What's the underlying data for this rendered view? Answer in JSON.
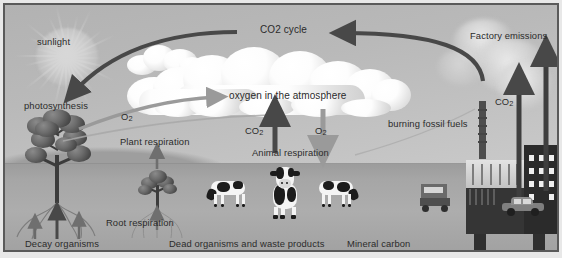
{
  "diagram": {
    "title": "CO2 cycle",
    "labels": {
      "sunlight": "sunlight",
      "co2_cycle": "CO2 cycle",
      "factory_emissions": "Factory emissions",
      "oxygen_atmosphere": "oxygen in the atmosphere",
      "photosynthesis": "photosynthesis",
      "o2_photosynthesis": "O",
      "o2_photosynthesis_sub": "2",
      "plant_respiration": "Plant respiration",
      "root_respiration": "Root respiration",
      "decay_organisms": "Decay organisms",
      "co2_animal": "CO",
      "co2_animal_sub": "2",
      "o2_animal": "O",
      "o2_animal_sub": "2",
      "animal_respiration": "Animal respiration",
      "dead_organisms": "Dead organisms and waste products",
      "mineral_carbon": "Mineral carbon",
      "burning_fossil_fuels": "burning fossil fuels",
      "co2_factory": "CO",
      "co2_factory_sub": "2"
    },
    "colors": {
      "frame_border": "#5a5a5a",
      "sky_top": "#b2b2b2",
      "sky_bottom": "#c9c9c9",
      "ground": "#a6a6a6",
      "arrow_dark": "#4a4a4a",
      "arrow_mid": "#6f6f6f",
      "arrow_light": "#9a9a9a",
      "cloud_white": "#ffffff",
      "text": "#2b2b2b"
    },
    "icons": {
      "sun": "sun-icon",
      "cloud": "cloud-icon",
      "tree": "tree-icon",
      "shrub": "shrub-icon",
      "cow": "cow-icon",
      "factory": "factory-icon",
      "car": "car-icon",
      "truck": "truck-icon",
      "chimney": "chimney-icon",
      "roots": "roots-icon"
    },
    "arrows": [
      {
        "name": "sunlight-to-photosynthesis",
        "tone": "dark"
      },
      {
        "name": "co2-cycle-return",
        "tone": "dark"
      },
      {
        "name": "factory-to-co2-cycle",
        "tone": "dark"
      },
      {
        "name": "photosynthesis-o2-to-atmosphere",
        "tone": "light"
      },
      {
        "name": "tree-to-atmosphere-lower",
        "tone": "light"
      },
      {
        "name": "plant-respiration-up",
        "tone": "mid"
      },
      {
        "name": "animal-respiration-co2-up",
        "tone": "dark"
      },
      {
        "name": "atmosphere-o2-down",
        "tone": "light"
      },
      {
        "name": "factory-co2-up-left",
        "tone": "dark"
      },
      {
        "name": "factory-co2-up-right",
        "tone": "dark"
      },
      {
        "name": "root-respiration-up",
        "tone": "mid"
      },
      {
        "name": "decay-organisms-up",
        "tone": "dark"
      }
    ]
  }
}
